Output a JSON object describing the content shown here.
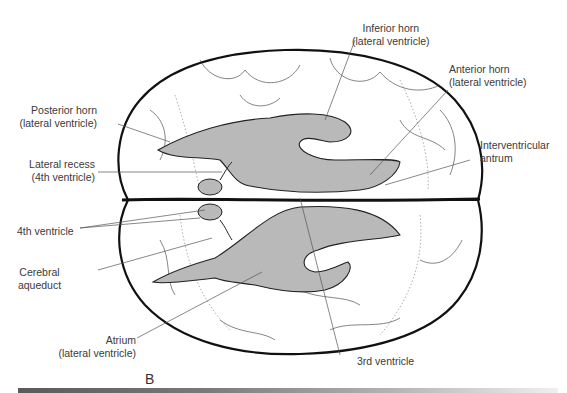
{
  "figure": {
    "panel": "B",
    "colors": {
      "ventricle_fill": "#b9b9b9",
      "outline": "#111111",
      "leader_line": "#555555",
      "text": "#3a3a3a"
    }
  },
  "labels": {
    "inferior_horn": {
      "line1": "Inferior horn",
      "line2": "(lateral ventricle)"
    },
    "anterior_horn": {
      "line1": "Anterior horn",
      "line2": "(lateral ventricle)"
    },
    "posterior_horn": {
      "line1": "Posterior horn",
      "line2": "(lateral ventricle)"
    },
    "interventricular_antrum": {
      "line1": "Interventricular",
      "line2": "antrum"
    },
    "lateral_recess": {
      "line1": "Lateral recess",
      "line2": "(4th ventricle)"
    },
    "fourth_ventricle": {
      "line1": "4th ventricle"
    },
    "cerebral_aqueduct": {
      "line1": "Cerebral",
      "line2": "aqueduct"
    },
    "atrium": {
      "line1": "Atrium",
      "line2": "(lateral ventricle)"
    },
    "third_ventricle": {
      "line1": "3rd ventricle"
    }
  }
}
